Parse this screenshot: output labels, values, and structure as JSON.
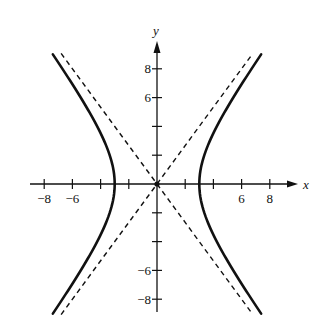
{
  "chart_data": {
    "type": "line",
    "title": "",
    "xlabel": "x",
    "ylabel": "y",
    "xlim": [
      -9,
      10
    ],
    "ylim": [
      -9,
      9.5
    ],
    "grid": false,
    "legend": null,
    "x_ticks": [
      -8,
      -6,
      -4,
      -2,
      2,
      4,
      6,
      8
    ],
    "x_tick_labels": [
      "-8",
      "-6",
      "",
      "",
      "",
      "",
      "6",
      "8"
    ],
    "y_ticks": [
      -8,
      -6,
      -4,
      -2,
      2,
      4,
      6,
      8
    ],
    "y_tick_labels": [
      "-8",
      "-6",
      "",
      "",
      "",
      "",
      "6",
      "8"
    ],
    "series": [
      {
        "name": "hyperbola",
        "equation": "x^2/9 - y^2/16 = 1",
        "style": "solid",
        "a": 3,
        "b": 4,
        "y_range": [
          -9,
          9
        ]
      },
      {
        "name": "asymptote-1",
        "equation": "y = 4x/3",
        "style": "dashed",
        "x_range": [
          -6.8,
          6.8
        ]
      },
      {
        "name": "asymptote-2",
        "equation": "y = -4x/3",
        "style": "dashed",
        "x_range": [
          -6.8,
          6.8
        ]
      }
    ],
    "annotations": [
      "origin point at (0,0)"
    ]
  },
  "layout": {
    "origin_px": [
      157,
      184
    ],
    "unit_x_px": 14.1,
    "unit_y_px": 14.4,
    "line_color": "#111111"
  }
}
